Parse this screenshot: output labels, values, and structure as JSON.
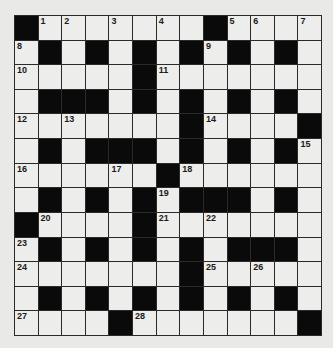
{
  "puzzle": {
    "rows": 13,
    "cols": 13,
    "layout": [
      "#........#...",
      ".#.#.#.#.#.#.",
      ".....#.......",
      ".###.#.#.#.#.",
      "......#.....#",
      ".#.###.#.#.#.",
      "......#......",
      "#.#.#.###.#.",
      "#....#.......",
      ".#.#.#.#...#.",
      ".......#.....",
      ".#.#.#.#.#.#.",
      "....#......#"
    ],
    "grid": [
      [
        "B",
        "1",
        "2",
        "",
        "3",
        "",
        "4",
        "",
        "B",
        "5",
        "6",
        "",
        "7"
      ],
      [
        "8",
        "B",
        "",
        "B",
        "",
        "B",
        "",
        "B",
        "9",
        "B",
        "",
        "B",
        ""
      ],
      [
        "10",
        "",
        "",
        "",
        "",
        "B",
        "11",
        "",
        "",
        "",
        "",
        "",
        ""
      ],
      [
        "",
        "B",
        "B",
        "B",
        "",
        "B",
        "",
        "B",
        "",
        "B",
        "",
        "B",
        ""
      ],
      [
        "12",
        "",
        "13",
        "",
        "",
        "",
        "",
        "B",
        "14",
        "",
        "",
        "",
        "B"
      ],
      [
        "",
        "B",
        "",
        "B",
        "B",
        "B",
        "",
        "B",
        "",
        "B",
        "",
        "B",
        "15"
      ],
      [
        "16",
        "",
        "",
        "",
        "17",
        "",
        "B",
        "18",
        "",
        "",
        "",
        "",
        ""
      ],
      [
        "",
        "B",
        "",
        "B",
        "",
        "B",
        "19",
        "B",
        "B",
        "B",
        "",
        "B",
        ""
      ],
      [
        "B",
        "20",
        "",
        "",
        "",
        "B",
        "21",
        "",
        "22",
        "",
        "",
        "",
        ""
      ],
      [
        "23",
        "B",
        "",
        "B",
        "",
        "B",
        "",
        "B",
        "",
        "B",
        "B",
        "B",
        ""
      ],
      [
        "24",
        "",
        "",
        "",
        "",
        "",
        "",
        "B",
        "25",
        "",
        "26",
        "",
        ""
      ],
      [
        "",
        "B",
        "",
        "B",
        "",
        "B",
        "",
        "B",
        "",
        "B",
        "",
        "B",
        ""
      ],
      [
        "27",
        "",
        "",
        "",
        "B",
        "28",
        "",
        "",
        "",
        "",
        "",
        "",
        "B"
      ]
    ]
  }
}
